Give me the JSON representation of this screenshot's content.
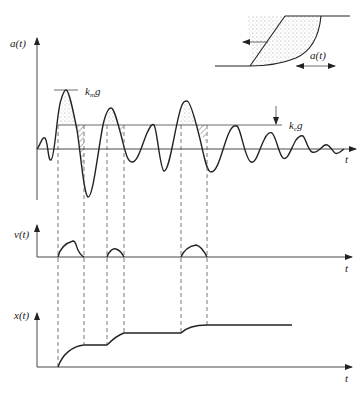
{
  "inset": {
    "label": "a(t)",
    "description": "Sliding soil wedge on slope under horizontal base acceleration"
  },
  "acceleration_plot": {
    "ylabel": "a(t)",
    "xlabel": "t",
    "critical_label_main": "k",
    "critical_label_sub": "c",
    "critical_label_tail": "g",
    "max_label_main": "k",
    "max_label_sub": "m",
    "max_label_tail": "g"
  },
  "velocity_plot": {
    "ylabel": "v(t)",
    "xlabel": "t"
  },
  "displacement_plot": {
    "ylabel": "x(t)",
    "xlabel": "t"
  },
  "colors": {
    "line": "#222222",
    "background": "#ffffff"
  }
}
